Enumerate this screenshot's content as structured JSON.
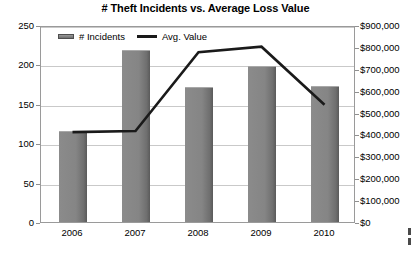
{
  "chart_data": {
    "type": "bar",
    "title": "# Theft Incidents vs. Average Loss Value",
    "xlabel": "",
    "ylabel": "",
    "categories": [
      "2006",
      "2007",
      "2008",
      "2009",
      "2010"
    ],
    "grid": true,
    "legend_position": "top-left-inside",
    "series": [
      {
        "name": "# Incidents",
        "type": "bar",
        "axis": "left",
        "color": "#808080",
        "values": [
          116,
          218,
          171,
          198,
          172
        ]
      },
      {
        "name": "Avg. Value",
        "type": "line",
        "axis": "right",
        "color": "#1a1a1a",
        "values": [
          420000,
          425000,
          785000,
          810000,
          545000
        ]
      }
    ],
    "left_axis": {
      "ylim": [
        0,
        250
      ],
      "step": 50,
      "ticks": [
        "0",
        "50",
        "100",
        "150",
        "200",
        "250"
      ]
    },
    "right_axis": {
      "ylim": [
        0,
        900000
      ],
      "step": 100000,
      "ticks": [
        "$0",
        "$100,000",
        "$200,000",
        "$300,000",
        "$400,000",
        "$500,000",
        "$600,000",
        "$700,000",
        "$800,000",
        "$900,000"
      ]
    }
  },
  "legend": {
    "items": [
      {
        "label": "# Incidents",
        "marker": "bar-swatch-icon"
      },
      {
        "label": "Avg. Value",
        "marker": "line-swatch-icon"
      }
    ]
  }
}
